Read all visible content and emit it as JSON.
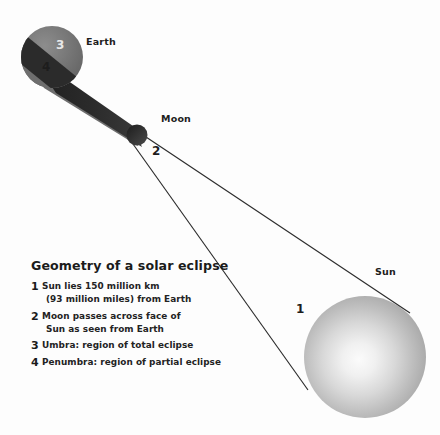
{
  "diagram": {
    "title": "Geometry of a solar eclipse",
    "background_color": "#fdfdfd",
    "bodies": {
      "earth": {
        "label": "Earth",
        "fill_color": "#757575",
        "cx": 52,
        "cy": 57,
        "r": 31
      },
      "moon": {
        "label": "Moon",
        "fill_color": "#3a3a3a",
        "cx": 137,
        "cy": 135,
        "r": 10
      },
      "sun": {
        "label": "Sun",
        "fill_color": "#b0b0b0",
        "highlight_color": "#f2f2f2",
        "cx": 365,
        "cy": 357,
        "r": 61
      }
    },
    "shadow": {
      "umbra_color": "#262626",
      "penumbra_color": "#6e6e6e",
      "ray_color": "#2b2b2b"
    },
    "markers": {
      "umbra_number": "3",
      "penumbra_number": "4",
      "moon_number": "2",
      "sun_number": "1"
    },
    "legend": [
      {
        "number": "1",
        "line1": "Sun lies 150 million km",
        "line2": "(93 million miles) from Earth"
      },
      {
        "number": "2",
        "line1": "Moon passes across face of",
        "line2": "Sun as seen from Earth"
      },
      {
        "number": "3",
        "line1": "Umbra: region of total eclipse",
        "line2": ""
      },
      {
        "number": "4",
        "line1": "Penumbra: region of partial eclipse",
        "line2": ""
      }
    ]
  }
}
